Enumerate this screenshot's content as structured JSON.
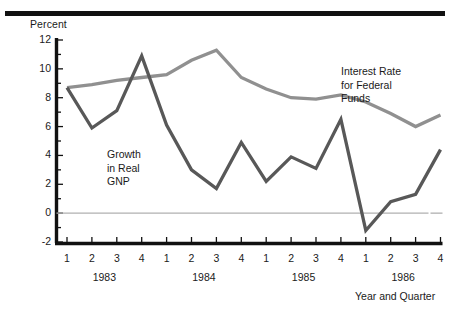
{
  "figure": {
    "y_axis_title": "Percent",
    "x_axis_title": "Year and Quarter",
    "annotations": {
      "gnp": "Growth\nin Real\nGNP",
      "rate": "Interest Rate\nfor Federal\nFunds"
    }
  },
  "colors": {
    "rule": "#111111",
    "axis": "#111111",
    "gnp_line": "#585858",
    "rate_line": "#909090",
    "zero_line": "#b0b0b0",
    "text": "#1a1a1a",
    "background": "#ffffff"
  },
  "chart_data": {
    "type": "line",
    "title": "",
    "xlabel": "Year and Quarter",
    "ylabel": "Percent",
    "ylim": [
      -2,
      12
    ],
    "yticks": [
      -2,
      0,
      2,
      4,
      6,
      8,
      10,
      12
    ],
    "ytick_labels": [
      "-2",
      "0",
      "2",
      "4",
      "6",
      "8",
      "10",
      "12"
    ],
    "minor_yticks": [
      -1,
      1,
      3,
      5,
      7,
      9,
      11
    ],
    "grid": false,
    "zero_line": true,
    "legend": "inline-annotations",
    "years": [
      "1983",
      "1984",
      "1985",
      "1986"
    ],
    "quarters": [
      "1",
      "2",
      "3",
      "4",
      "1",
      "2",
      "3",
      "4",
      "1",
      "2",
      "3",
      "4",
      "1",
      "2",
      "3",
      "4"
    ],
    "x": [
      "1983 Q1",
      "1983 Q2",
      "1983 Q3",
      "1983 Q4",
      "1984 Q1",
      "1984 Q2",
      "1984 Q3",
      "1984 Q4",
      "1985 Q1",
      "1985 Q2",
      "1985 Q3",
      "1985 Q4",
      "1986 Q1",
      "1986 Q2",
      "1986 Q3",
      "1986 Q4"
    ],
    "series": [
      {
        "name": "Growth in Real GNP",
        "color": "#585858",
        "values": [
          8.7,
          5.9,
          7.1,
          10.9,
          6.1,
          3.0,
          1.7,
          4.9,
          2.2,
          3.9,
          3.1,
          6.5,
          -1.2,
          0.8,
          1.3,
          4.4
        ]
      },
      {
        "name": "Interest Rate for Federal Funds",
        "color": "#909090",
        "values": [
          8.7,
          8.9,
          9.2,
          9.4,
          9.6,
          10.6,
          11.3,
          9.4,
          8.6,
          8.0,
          7.9,
          8.2,
          7.7,
          6.9,
          6.0,
          6.8
        ]
      }
    ]
  }
}
